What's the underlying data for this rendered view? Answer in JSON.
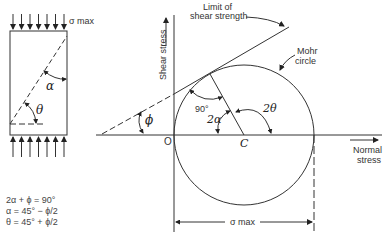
{
  "specimen": {
    "load_label": "σ max",
    "angle_alpha": "α",
    "angle_theta": "θ"
  },
  "formulas": [
    "2α + ϕ = 90°",
    "α = 45° − ϕ/2",
    "θ = 45° + ϕ/2"
  ],
  "mohr": {
    "limit_label_line1": "Limit of",
    "limit_label_line2": "shear strength",
    "circle_label_line1": "Mohr",
    "circle_label_line2": "circle",
    "y_axis_label": "Shear stress",
    "x_axis_label_line1": "Normal",
    "x_axis_label_line2": "stress",
    "origin_label": "O",
    "center_label": "C",
    "phi_label": "ϕ",
    "right_angle_label": "90°",
    "two_alpha_label": "2α",
    "two_theta_label": "2θ",
    "dimension_label": "σ max"
  },
  "colors": {
    "line": "#333333",
    "background": "#ffffff"
  }
}
